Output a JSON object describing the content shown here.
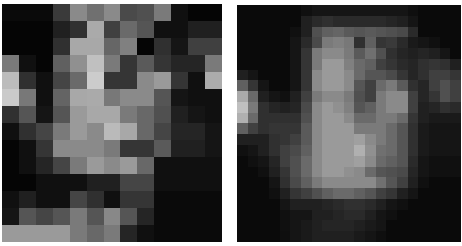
{
  "figure": {
    "panels": [
      {
        "name": "coarse-pixelated-face",
        "cols": 13,
        "rows": 14,
        "grid": [
          [
            "#0a0a0a",
            "#0a0a0a",
            "#0a0a0a",
            "#3a3a3a",
            "#8a8a8a",
            "#707070",
            "#8a8a8a",
            "#4a4a4a",
            "#505050",
            "#7a7a7a",
            "#101010",
            "#050505",
            "#050505"
          ],
          [
            "#050505",
            "#050505",
            "#050505",
            "#202020",
            "#303030",
            "#aaaaaa",
            "#404040",
            "#6a6a6a",
            "#555555",
            "#101010",
            "#101010",
            "#202020",
            "#202020"
          ],
          [
            "#050505",
            "#050505",
            "#050505",
            "#303030",
            "#a8a8a8",
            "#a8a8a8",
            "#666666",
            "#808080",
            "#050505",
            "#303030",
            "#151515",
            "#404040",
            "#404040"
          ],
          [
            "#7a7a7a",
            "#101010",
            "#050505",
            "#606060",
            "#909090",
            "#c0c0c0",
            "#7a7a7a",
            "#353535",
            "#5a5a5a",
            "#353535",
            "#252525",
            "#252525",
            "#7a7a7a"
          ],
          [
            "#bcbcbc",
            "#303030",
            "#101010",
            "#454545",
            "#6a6a6a",
            "#cccccc",
            "#353535",
            "#353535",
            "#8a8a8a",
            "#9a9a9a",
            "#353535",
            "#101010",
            "#acacac"
          ],
          [
            "#cacaca",
            "#787878",
            "#101010",
            "#646464",
            "#a8a8a8",
            "#aaaaaa",
            "#787878",
            "#8a8a8a",
            "#8a8a8a",
            "#555555",
            "#151515",
            "#101010",
            "#101010"
          ],
          [
            "#303030",
            "#555555",
            "#151515",
            "#555555",
            "#9a9a9a",
            "#a8a8a8",
            "#a8a8a8",
            "#7a7a7a",
            "#686868",
            "#505050",
            "#202020",
            "#151515",
            "#101010"
          ],
          [
            "#101010",
            "#303030",
            "#454545",
            "#7a7a7a",
            "#9a9a9a",
            "#8a8a8a",
            "#bababa",
            "#a8a8a8",
            "#686868",
            "#454545",
            "#252525",
            "#252525",
            "#151515"
          ],
          [
            "#050505",
            "#101010",
            "#353535",
            "#8a8a8a",
            "#8a8a8a",
            "#8a8a8a",
            "#7a7a7a",
            "#353535",
            "#353535",
            "#5a5a5a",
            "#202020",
            "#202020",
            "#151515"
          ],
          [
            "#050505",
            "#101010",
            "#252525",
            "#454545",
            "#7a7a7a",
            "#9a9a9a",
            "#8a8a8a",
            "#9a9a9a",
            "#686868",
            "#101010",
            "#101010",
            "#101010",
            "#101010"
          ],
          [
            "#050505",
            "#050505",
            "#101010",
            "#101010",
            "#101010",
            "#202020",
            "#202020",
            "#454545",
            "#454545",
            "#101010",
            "#101010",
            "#101010",
            "#101010"
          ],
          [
            "#101010",
            "#202020",
            "#101010",
            "#101010",
            "#454545",
            "#303030",
            "#101010",
            "#353535",
            "#353535",
            "#0a0a0a",
            "#0a0a0a",
            "#0a0a0a",
            "#0a0a0a"
          ],
          [
            "#151515",
            "#555555",
            "#454545",
            "#555555",
            "#7a7a7a",
            "#555555",
            "#888888",
            "#555555",
            "#252525",
            "#0a0a0a",
            "#0a0a0a",
            "#0a0a0a",
            "#0a0a0a"
          ],
          [
            "#9a9a9a",
            "#9a9a9a",
            "#9a9a9a",
            "#9a9a9a",
            "#7a7a7a",
            "#686868",
            "#7a7a7a",
            "#252525",
            "#101010",
            "#0a0a0a",
            "#0a0a0a",
            "#0a0a0a",
            "#0a0a0a"
          ]
        ]
      },
      {
        "name": "fine-pixelated-face",
        "cols": 21,
        "rows": 22,
        "grid": [
          [
            "#0a0a0a",
            "#0a0a0a",
            "#0a0a0a",
            "#0a0a0a",
            "#0a0a0a",
            "#0a0a0a",
            "#101010",
            "#151515",
            "#151515",
            "#151515",
            "#151515",
            "#151515",
            "#151515",
            "#151515",
            "#151515",
            "#151515",
            "#0f0f0f",
            "#0a0a0a",
            "#0a0a0a",
            "#0a0a0a",
            "#0a0a0a"
          ],
          [
            "#0a0a0a",
            "#0a0a0a",
            "#0a0a0a",
            "#0a0a0a",
            "#0a0a0a",
            "#0a0a0a",
            "#202020",
            "#2a2a2a",
            "#303030",
            "#2a2a2a",
            "#2a2a2a",
            "#2a2a2a",
            "#2a2a2a",
            "#2a2a2a",
            "#252525",
            "#202020",
            "#151515",
            "#0a0a0a",
            "#0a0a0a",
            "#0a0a0a",
            "#0a0a0a"
          ],
          [
            "#0a0a0a",
            "#0a0a0a",
            "#0a0a0a",
            "#0a0a0a",
            "#0a0a0a",
            "#101010",
            "#202020",
            "#505050",
            "#606060",
            "#656565",
            "#5a5a5a",
            "#555555",
            "#5a5a5a",
            "#555555",
            "#505050",
            "#4a4a4a",
            "#2a2a2a",
            "#0a0a0a",
            "#0a0a0a",
            "#0a0a0a",
            "#0a0a0a"
          ],
          [
            "#0a0a0a",
            "#0a0a0a",
            "#0a0a0a",
            "#0a0a0a",
            "#0a0a0a",
            "#151515",
            "#2a2a2a",
            "#4a4a4a",
            "#7a7a7a",
            "#808080",
            "#787878",
            "#303030",
            "#606060",
            "#353535",
            "#3a3a3a",
            "#2a2a2a",
            "#1a1a1a",
            "#151515",
            "#101010",
            "#0a0a0a",
            "#0a0a0a"
          ],
          [
            "#0a0a0a",
            "#0a0a0a",
            "#0a0a0a",
            "#0a0a0a",
            "#0a0a0a",
            "#151515",
            "#353535",
            "#7a7a7a",
            "#8a8a8a",
            "#8a8a8a",
            "#7a7a7a",
            "#5a5a5a",
            "#707070",
            "#505050",
            "#303030",
            "#252525",
            "#202020",
            "#252525",
            "#202020",
            "#151515",
            "#0a0a0a"
          ],
          [
            "#0a0a0a",
            "#0a0a0a",
            "#0a0a0a",
            "#0a0a0a",
            "#0a0a0a",
            "#151515",
            "#353535",
            "#7a7a7a",
            "#9a9a9a",
            "#9a9a9a",
            "#808080",
            "#6a6a6a",
            "#606060",
            "#404040",
            "#353535",
            "#2a2a2a",
            "#252525",
            "#303030",
            "#353535",
            "#303030",
            "#202020"
          ],
          [
            "#202020",
            "#151515",
            "#0a0a0a",
            "#0a0a0a",
            "#0a0a0a",
            "#151515",
            "#353535",
            "#8a8a8a",
            "#9a9a9a",
            "#9a9a9a",
            "#8a8a8a",
            "#6a6a6a",
            "#555555",
            "#555555",
            "#4a4a4a",
            "#353535",
            "#252525",
            "#303030",
            "#404040",
            "#404040",
            "#353535"
          ],
          [
            "#606060",
            "#353535",
            "#151515",
            "#0a0a0a",
            "#0a0a0a",
            "#151515",
            "#353535",
            "#8a8a8a",
            "#9a9a9a",
            "#9a9a9a",
            "#8a8a8a",
            "#555555",
            "#404040",
            "#6a6a6a",
            "#7a7a7a",
            "#5a5a5a",
            "#303030",
            "#252525",
            "#404040",
            "#505050",
            "#404040"
          ],
          [
            "#aaaaaa",
            "#6a6a6a",
            "#202020",
            "#151515",
            "#101010",
            "#202020",
            "#404040",
            "#7a7a7a",
            "#8a8a8a",
            "#8a8a8a",
            "#7a7a7a",
            "#505050",
            "#404040",
            "#7a7a7a",
            "#8a8a8a",
            "#8a8a8a",
            "#404040",
            "#252525",
            "#353535",
            "#505050",
            "#404040"
          ],
          [
            "#c0c0c0",
            "#7a7a7a",
            "#303030",
            "#252525",
            "#202020",
            "#252525",
            "#4a4a4a",
            "#8a8a8a",
            "#9a9a9a",
            "#909090",
            "#808080",
            "#555555",
            "#606060",
            "#7a7a7a",
            "#8a8a8a",
            "#8a8a8a",
            "#404040",
            "#202020",
            "#252525",
            "#303030",
            "#2a2a2a"
          ],
          [
            "#b0b0b0",
            "#6a6a6a",
            "#303030",
            "#303030",
            "#303030",
            "#303030",
            "#505050",
            "#8a8a8a",
            "#9a9a9a",
            "#9a9a9a",
            "#8a8a8a",
            "#6a6a6a",
            "#6a6a6a",
            "#7a7a7a",
            "#7a7a7a",
            "#6a6a6a",
            "#353535",
            "#202020",
            "#1a1a1a",
            "#1a1a1a",
            "#1a1a1a"
          ],
          [
            "#606060",
            "#404040",
            "#303030",
            "#353535",
            "#353535",
            "#353535",
            "#5a5a5a",
            "#8a8a8a",
            "#9a9a9a",
            "#9a9a9a",
            "#9a9a9a",
            "#7a7a7a",
            "#7a7a7a",
            "#7a7a7a",
            "#6a6a6a",
            "#555555",
            "#303030",
            "#1a1a1a",
            "#151515",
            "#151515",
            "#151515"
          ],
          [
            "#202020",
            "#202020",
            "#202020",
            "#303030",
            "#353535",
            "#404040",
            "#5a5a5a",
            "#8a8a8a",
            "#9a9a9a",
            "#9a9a9a",
            "#9a9a9a",
            "#a0a0a0",
            "#8a8a8a",
            "#7a7a7a",
            "#6a6a6a",
            "#555555",
            "#303030",
            "#1a1a1a",
            "#151515",
            "#151515",
            "#151515"
          ],
          [
            "#101010",
            "#151515",
            "#202020",
            "#303030",
            "#404040",
            "#4a4a4a",
            "#606060",
            "#8a8a8a",
            "#9a9a9a",
            "#9a9a9a",
            "#9a9a9a",
            "#b0b0b0",
            "#909090",
            "#707070",
            "#6a6a6a",
            "#555555",
            "#303030",
            "#1a1a1a",
            "#151515",
            "#151515",
            "#151515"
          ],
          [
            "#0a0a0a",
            "#101010",
            "#151515",
            "#252525",
            "#404040",
            "#505050",
            "#6a6a6a",
            "#8a8a8a",
            "#9a9a9a",
            "#9a9a9a",
            "#9a9a9a",
            "#a0a0a0",
            "#8a8a8a",
            "#6a6a6a",
            "#606060",
            "#555555",
            "#2a2a2a",
            "#151515",
            "#101010",
            "#101010",
            "#101010"
          ],
          [
            "#0a0a0a",
            "#0a0a0a",
            "#101010",
            "#202020",
            "#353535",
            "#505050",
            "#6a6a6a",
            "#8a8a8a",
            "#9a9a9a",
            "#9a9a9a",
            "#909090",
            "#8a8a8a",
            "#6a6a6a",
            "#555555",
            "#505050",
            "#4a4a4a",
            "#252525",
            "#151515",
            "#101010",
            "#101010",
            "#101010"
          ],
          [
            "#0a0a0a",
            "#0a0a0a",
            "#0a0a0a",
            "#151515",
            "#303030",
            "#4a4a4a",
            "#606060",
            "#7a7a7a",
            "#8a8a8a",
            "#8a8a8a",
            "#8a8a8a",
            "#8a8a8a",
            "#8a8a8a",
            "#707070",
            "#555555",
            "#404040",
            "#202020",
            "#101010",
            "#0a0a0a",
            "#0a0a0a",
            "#0a0a0a"
          ],
          [
            "#0a0a0a",
            "#0a0a0a",
            "#0a0a0a",
            "#101010",
            "#202020",
            "#353535",
            "#404040",
            "#505050",
            "#606060",
            "#6a6a6a",
            "#6a6a6a",
            "#606060",
            "#555555",
            "#404040",
            "#353535",
            "#202020",
            "#151515",
            "#0a0a0a",
            "#0a0a0a",
            "#0a0a0a",
            "#0a0a0a"
          ],
          [
            "#0a0a0a",
            "#0a0a0a",
            "#0a0a0a",
            "#0a0a0a",
            "#151515",
            "#202020",
            "#202020",
            "#202020",
            "#252525",
            "#2a2a2a",
            "#303030",
            "#303030",
            "#2a2a2a",
            "#202020",
            "#151515",
            "#101010",
            "#0a0a0a",
            "#0a0a0a",
            "#0a0a0a",
            "#0a0a0a",
            "#0a0a0a"
          ],
          [
            "#0a0a0a",
            "#0a0a0a",
            "#0a0a0a",
            "#0a0a0a",
            "#101010",
            "#151515",
            "#151515",
            "#202020",
            "#202020",
            "#252525",
            "#2a2a2a",
            "#2a2a2a",
            "#202020",
            "#151515",
            "#101010",
            "#0a0a0a",
            "#0a0a0a",
            "#0a0a0a",
            "#0a0a0a",
            "#0a0a0a",
            "#0a0a0a"
          ],
          [
            "#0a0a0a",
            "#0a0a0a",
            "#0a0a0a",
            "#0a0a0a",
            "#101010",
            "#151515",
            "#1a1a1a",
            "#202020",
            "#252525",
            "#252525",
            "#252525",
            "#202020",
            "#1a1a1a",
            "#151515",
            "#0a0a0a",
            "#0a0a0a",
            "#0a0a0a",
            "#0a0a0a",
            "#0a0a0a",
            "#0a0a0a",
            "#0a0a0a"
          ],
          [
            "#0a0a0a",
            "#0a0a0a",
            "#0a0a0a",
            "#0a0a0a",
            "#0f0f0f",
            "#151515",
            "#1a1a1a",
            "#202020",
            "#202020",
            "#202020",
            "#202020",
            "#1a1a1a",
            "#151515",
            "#0f0f0f",
            "#0a0a0a",
            "#0a0a0a",
            "#0a0a0a",
            "#0a0a0a",
            "#0a0a0a",
            "#0a0a0a",
            "#0a0a0a"
          ]
        ]
      }
    ]
  }
}
